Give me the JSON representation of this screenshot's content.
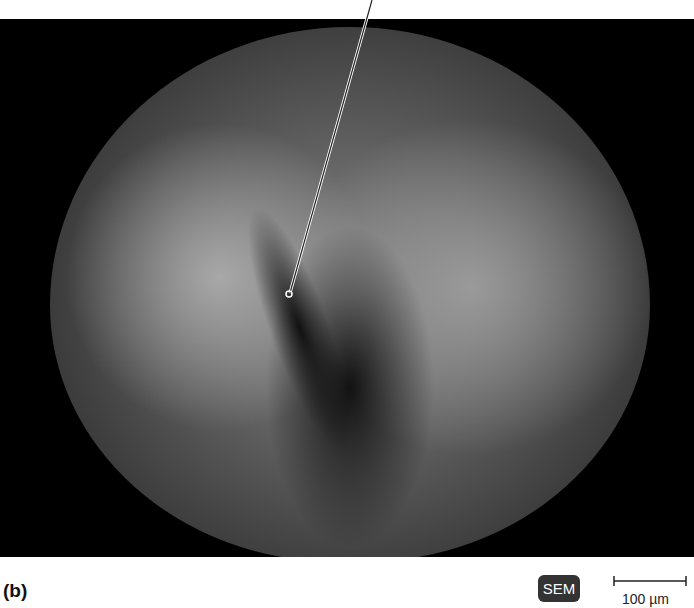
{
  "figure": {
    "panel_label": "(b)",
    "imaging_badge": "SEM",
    "scale_bar_label": "100 µm"
  },
  "colors": {
    "background": "#000000",
    "badge_bg": "#333333",
    "badge_text": "#ffffff"
  }
}
